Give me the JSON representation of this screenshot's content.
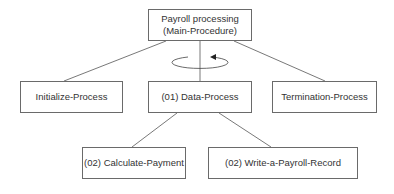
{
  "diagram": {
    "root": {
      "line1": "Payroll processing",
      "line2": "(Main-Procedure)"
    },
    "level1": [
      {
        "label": "Initialize-Process"
      },
      {
        "label": "(01) Data-Process"
      },
      {
        "label": "Termination-Process"
      }
    ],
    "level2": [
      {
        "label": "(02) Calculate-Payment"
      },
      {
        "label": "(02) Write-a-Payroll-Record"
      }
    ],
    "loop_indicator": "iteration-loop-arrow",
    "colors": {
      "line": "#555555",
      "border": "#6a6a6a",
      "text": "#333333"
    }
  }
}
